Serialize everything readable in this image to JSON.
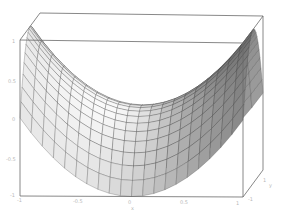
{
  "chart_data": {
    "type": "surface3d",
    "title": "",
    "function": "z = x^2 - y^2 (hyperbolic paraboloid / saddle)",
    "xlabel": "x",
    "ylabel": "y",
    "zlabel": "",
    "x_range": [
      -1,
      1
    ],
    "y_range": [
      -1,
      1
    ],
    "z_range": [
      -1,
      1
    ],
    "grid_lines": 20,
    "shading": "grayscale",
    "box": true,
    "x_ticks": [
      "-1",
      "-0.5",
      "0",
      "0.5",
      "1"
    ],
    "z_ticks": [
      "1",
      "0.5",
      "0",
      "-0.5",
      "-1"
    ],
    "y_ticks": [
      "-1",
      "1"
    ]
  },
  "axis": {
    "x_ticks": [
      {
        "label": "-1",
        "x": 17,
        "y": 198
      },
      {
        "label": "-0.5",
        "x": 73,
        "y": 199
      },
      {
        "label": "0",
        "x": 128,
        "y": 200
      },
      {
        "label": "0.5",
        "x": 180,
        "y": 200
      },
      {
        "label": "1",
        "x": 236,
        "y": 201
      }
    ],
    "y_ticks": [
      {
        "label": "-1",
        "x": 248,
        "y": 197
      },
      {
        "label": "1",
        "x": 263,
        "y": 178
      }
    ],
    "y_axis_label": {
      "label": "y",
      "x": 269,
      "y": 183
    },
    "x_axis_label": {
      "label": "x",
      "x": 131,
      "y": 206
    },
    "z_ticks": [
      {
        "label": "1",
        "x": 12,
        "y": 39
      },
      {
        "label": "0.5",
        "x": 8,
        "y": 79
      },
      {
        "label": "0",
        "x": 12,
        "y": 117
      },
      {
        "label": "-0.5",
        "x": 6,
        "y": 157
      },
      {
        "label": "-1",
        "x": 10,
        "y": 193
      }
    ]
  },
  "colors": {
    "frame": "#6a6a6a",
    "mesh": "#3a3a3a",
    "surface_light": "#f2f2f2",
    "surface_dark": "#6e6e6e",
    "background": "#ffffff"
  }
}
